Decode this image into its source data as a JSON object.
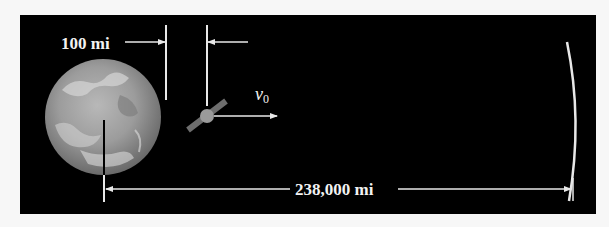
{
  "figure": {
    "altitude_label": "100 mi",
    "velocity_label": "v",
    "velocity_subscript": "0",
    "distance_label": "238,000 mi",
    "objects": {
      "earth": "earth-icon",
      "satellite": "satellite-icon",
      "moon_orbit": "moon-arc"
    }
  },
  "colors": {
    "background": "#000000",
    "page": "#f7f7f7",
    "lines": "#e8e8e8",
    "satellite_body": "#9a9a9a",
    "satellite_panel": "#6e6e6e"
  }
}
